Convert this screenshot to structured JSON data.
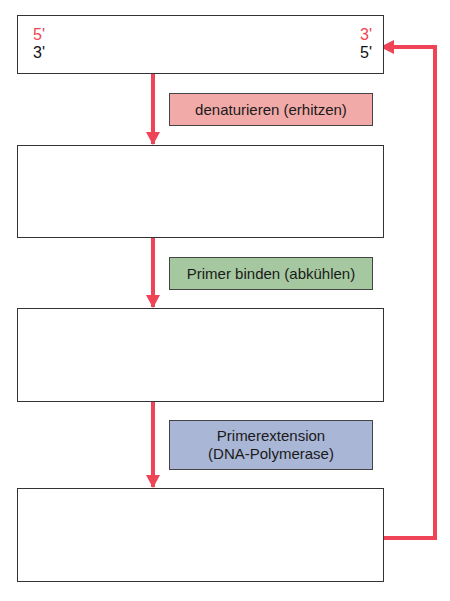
{
  "colors": {
    "red": "#ee4455",
    "black": "#111111",
    "step1_bg": "#f2aaa8",
    "step2_bg": "#a6c8a0",
    "step3_bg": "#a9b6d6"
  },
  "panel1": {
    "top_left": "5'",
    "top_right": "3'",
    "bottom_left": "3'",
    "bottom_right": "5'"
  },
  "steps": [
    {
      "label": "denaturieren (erhitzen)"
    },
    {
      "label": "Primer binden (abkühlen)"
    },
    {
      "label_line1": "Primerextension",
      "label_line2": "(DNA-Polymerase)"
    }
  ]
}
